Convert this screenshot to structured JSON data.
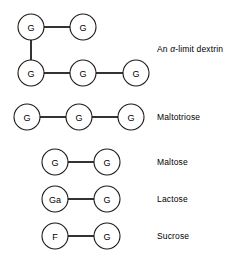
{
  "figure": {
    "background_color": "#ffffff",
    "line_color": "#000000",
    "node_fill": "#ffffff",
    "node_stroke": "#1a1a1a"
  },
  "rows": [
    {
      "id": "alpha-limit-dextrin",
      "label_prefix": "An ",
      "label_alpha": "α",
      "label_suffix": "-limit dextrin",
      "label_full": "An α-limit dextrin",
      "label_x": 157,
      "label_y": 45,
      "nodes": [
        {
          "text": "G",
          "cx": 31,
          "cy": 27,
          "r": 13
        },
        {
          "text": "G",
          "cx": 83,
          "cy": 27,
          "r": 13
        },
        {
          "text": "G",
          "cx": 31,
          "cy": 73,
          "r": 13
        },
        {
          "text": "G",
          "cx": 83,
          "cy": 73,
          "r": 13
        },
        {
          "text": "G",
          "cx": 136,
          "cy": 73,
          "r": 13
        }
      ],
      "bonds": [
        {
          "x1": 44,
          "y1": 27,
          "x2": 70,
          "y2": 27
        },
        {
          "x1": 31,
          "y1": 40,
          "x2": 31,
          "y2": 60
        },
        {
          "x1": 44,
          "y1": 73,
          "x2": 70,
          "y2": 73
        },
        {
          "x1": 96,
          "y1": 73,
          "x2": 123,
          "y2": 73
        }
      ]
    },
    {
      "id": "maltotriose",
      "label_prefix": "Maltotriose",
      "label_alpha": "",
      "label_suffix": "",
      "label_full": "Maltotriose",
      "label_x": 157,
      "label_y": 113,
      "nodes": [
        {
          "text": "G",
          "cx": 27,
          "cy": 117,
          "r": 13
        },
        {
          "text": "G",
          "cx": 79,
          "cy": 117,
          "r": 13
        },
        {
          "text": "G",
          "cx": 131,
          "cy": 117,
          "r": 13
        }
      ],
      "bonds": [
        {
          "x1": 40,
          "y1": 117,
          "x2": 66,
          "y2": 117
        },
        {
          "x1": 92,
          "y1": 117,
          "x2": 118,
          "y2": 117
        }
      ]
    },
    {
      "id": "maltose",
      "label_prefix": "Maltose",
      "label_alpha": "",
      "label_suffix": "",
      "label_full": "Maltose",
      "label_x": 157,
      "label_y": 158,
      "nodes": [
        {
          "text": "G",
          "cx": 55,
          "cy": 162,
          "r": 13
        },
        {
          "text": "G",
          "cx": 107,
          "cy": 162,
          "r": 13
        }
      ],
      "bonds": [
        {
          "x1": 68,
          "y1": 162,
          "x2": 94,
          "y2": 162
        }
      ]
    },
    {
      "id": "lactose",
      "label_prefix": "Lactose",
      "label_alpha": "",
      "label_suffix": "",
      "label_full": "Lactose",
      "label_x": 157,
      "label_y": 195,
      "nodes": [
        {
          "text": "Ga",
          "cx": 55,
          "cy": 199,
          "r": 13
        },
        {
          "text": "G",
          "cx": 107,
          "cy": 199,
          "r": 13
        }
      ],
      "bonds": [
        {
          "x1": 68,
          "y1": 199,
          "x2": 94,
          "y2": 199
        }
      ]
    },
    {
      "id": "sucrose",
      "label_prefix": "Sucrose",
      "label_alpha": "",
      "label_suffix": "",
      "label_full": "Sucrose",
      "label_x": 157,
      "label_y": 232,
      "nodes": [
        {
          "text": "F",
          "cx": 55,
          "cy": 236,
          "r": 13
        },
        {
          "text": "G",
          "cx": 107,
          "cy": 236,
          "r": 13
        }
      ],
      "bonds": [
        {
          "x1": 68,
          "y1": 236,
          "x2": 94,
          "y2": 236
        }
      ]
    }
  ]
}
